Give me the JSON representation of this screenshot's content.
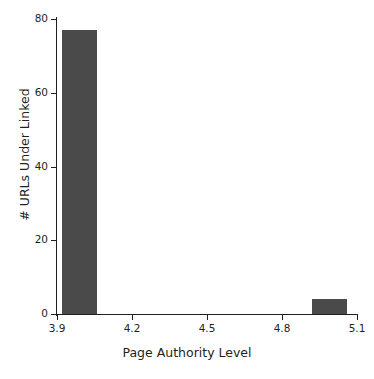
{
  "chart_data": {
    "type": "bar",
    "title": "",
    "subtitle": "",
    "xlabel": "Page Authority Level",
    "ylabel": "# URLs Under Linked",
    "xlim": [
      3.9,
      5.1
    ],
    "ylim": [
      0,
      80
    ],
    "xticks": [
      3.9,
      4.2,
      4.5,
      4.8,
      5.1
    ],
    "xtick_labels": [
      "3.9",
      "4.2",
      "4.5",
      "4.8",
      "5.1"
    ],
    "yticks": [
      0,
      20,
      40,
      60,
      80
    ],
    "ytick_labels": [
      "0",
      "20",
      "40",
      "60",
      "80"
    ],
    "grid": false,
    "legend": null,
    "legend_position": "none",
    "bar_color": "#4a4a4a",
    "axis_color": "#231f20",
    "background_color": "#ffffff",
    "annotations": [],
    "bars": [
      {
        "x_start": 3.92,
        "x_end": 4.06,
        "x_center": 3.99,
        "value": 77
      },
      {
        "x_start": 4.92,
        "x_end": 5.06,
        "x_center": 4.99,
        "value": 4
      }
    ],
    "categories": [
      "3.99",
      "4.99"
    ],
    "values": [
      77,
      4
    ]
  }
}
